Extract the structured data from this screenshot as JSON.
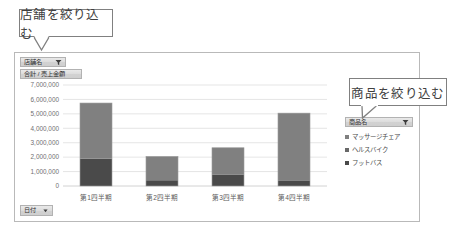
{
  "callouts": [
    {
      "name": "store-filter-callout",
      "text": "店舗を絞り込む"
    },
    {
      "name": "product-filter-callout",
      "text": "商品を絞り込む"
    }
  ],
  "chart_panel": {
    "field_buttons": {
      "store": {
        "label": "店舗名",
        "icon": "filter-dropdown-icon"
      },
      "value": {
        "label": "合計 / 売上金額",
        "icon": "none"
      },
      "axis": {
        "label": "日付",
        "icon": "dropdown-arrow-icon"
      },
      "legend": {
        "label": "商品名",
        "icon": "filter-dropdown-icon"
      }
    }
  },
  "chart_data": {
    "type": "bar",
    "stacked": true,
    "title": "",
    "xlabel": "",
    "ylabel": "",
    "categories": [
      "第1四半期",
      "第2四半期",
      "第3四半期",
      "第4四半期"
    ],
    "series": [
      {
        "name": "マッサージチェア",
        "color": "#808080",
        "values": [
          3850000,
          1650000,
          1850000,
          4700000
        ]
      },
      {
        "name": "ヘルスバイク",
        "color": "#686868",
        "values": [
          0,
          0,
          0,
          0
        ]
      },
      {
        "name": "フットバス",
        "color": "#4a4a4a",
        "values": [
          1900000,
          400000,
          800000,
          350000
        ]
      }
    ],
    "ylim": [
      0,
      7000000
    ],
    "ytick_values": [
      0,
      1000000,
      2000000,
      3000000,
      4000000,
      5000000,
      6000000,
      7000000
    ],
    "ytick_labels": [
      "0",
      "1,000,000",
      "2,000,000",
      "3,000,000",
      "4,000,000",
      "5,000,000",
      "6,000,000",
      "7,000,000"
    ],
    "grid": true,
    "legend_position": "right",
    "legend_entries": [
      "マッサージチェア",
      "ヘルスバイク",
      "フットバス"
    ],
    "bar_totals": [
      5750000,
      2050000,
      2650000,
      5050000
    ]
  }
}
